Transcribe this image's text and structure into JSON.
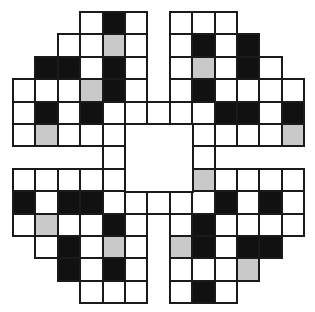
{
  "puzzle": {
    "type": "crossword-style grid",
    "rows": 13,
    "cols": 13,
    "origin_px": [
      13,
      12
    ],
    "cell_pitch_px": 22.4,
    "legend": {
      "W": "white (open) cell",
      "B": "black (blocked) cell",
      "G": "gray (shaded) cell",
      "": "no cell"
    },
    "colors": {
      "W": "#ffffff",
      "B": "#111111",
      "G": "#c9c9c9",
      "grid_line": "#1a1a1a"
    },
    "center_void": {
      "row": 5,
      "col": 5,
      "rows": 3,
      "cols": 3
    },
    "grid": [
      [
        "",
        "",
        "",
        "W",
        "B",
        "W",
        "",
        "W",
        "W",
        "W",
        "",
        "",
        ""
      ],
      [
        "",
        "",
        "W",
        "W",
        "G",
        "W",
        "",
        "W",
        "B",
        "W",
        "B",
        "",
        ""
      ],
      [
        "",
        "B",
        "B",
        "W",
        "B",
        "W",
        "",
        "W",
        "G",
        "W",
        "B",
        "W",
        ""
      ],
      [
        "W",
        "W",
        "W",
        "G",
        "B",
        "W",
        "",
        "W",
        "B",
        "W",
        "W",
        "W",
        "W"
      ],
      [
        "W",
        "B",
        "W",
        "B",
        "W",
        "W",
        "W",
        "W",
        "W",
        "B",
        "B",
        "W",
        "B"
      ],
      [
        "W",
        "G",
        "W",
        "W",
        "W",
        "",
        "",
        "",
        "W",
        "W",
        "W",
        "W",
        "G"
      ],
      [
        "",
        "",
        "",
        "",
        "W",
        "",
        "",
        "",
        "W",
        "",
        "",
        "",
        ""
      ],
      [
        "W",
        "W",
        "W",
        "W",
        "W",
        "",
        "",
        "",
        "G",
        "W",
        "W",
        "W",
        "W"
      ],
      [
        "B",
        "W",
        "B",
        "B",
        "W",
        "W",
        "W",
        "W",
        "W",
        "B",
        "W",
        "B",
        "W"
      ],
      [
        "W",
        "G",
        "W",
        "W",
        "B",
        "W",
        "",
        "W",
        "B",
        "W",
        "W",
        "W",
        "W"
      ],
      [
        "",
        "W",
        "B",
        "W",
        "G",
        "W",
        "",
        "G",
        "B",
        "W",
        "B",
        "B",
        ""
      ],
      [
        "",
        "",
        "B",
        "W",
        "B",
        "W",
        "",
        "W",
        "W",
        "W",
        "G",
        "",
        ""
      ],
      [
        "",
        "",
        "",
        "W",
        "W",
        "W",
        "",
        "W",
        "B",
        "W",
        "",
        "",
        ""
      ]
    ]
  }
}
